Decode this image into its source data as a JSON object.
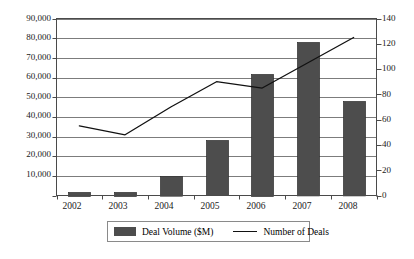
{
  "chart_data": {
    "type": "bar",
    "title": "",
    "xlabel": "",
    "ylabel": "",
    "categories": [
      "2002",
      "2003",
      "2004",
      "2005",
      "2006",
      "2007",
      "2008"
    ],
    "series": [
      {
        "name": "Deal Volume ($M)",
        "type": "bar",
        "axis": "left",
        "color": "#4d4d4d",
        "values": [
          2000,
          2000,
          10000,
          28000,
          62000,
          78000,
          48000
        ]
      },
      {
        "name": "Number of Deals",
        "type": "line",
        "axis": "right",
        "color": "#111111",
        "values": [
          55,
          48,
          70,
          90,
          85,
          105,
          125
        ]
      }
    ],
    "left_axis": {
      "ylim": [
        0,
        90000
      ],
      "tick_step": 10000,
      "ticks": [
        "0",
        "10,000",
        "20,000",
        "30,000",
        "40,000",
        "50,000",
        "60,000",
        "70,000",
        "80,000",
        "90,000"
      ],
      "visible_ticks": [
        "10,000",
        "20,000",
        "30,000",
        "40,000",
        "50,000",
        "60,000",
        "70,000",
        "80,000",
        "90,000"
      ]
    },
    "right_axis": {
      "ylim": [
        0,
        140
      ],
      "tick_step": 20,
      "ticks": [
        "0",
        "20",
        "40",
        "60",
        "80",
        "100",
        "120",
        "140"
      ]
    },
    "grid": true,
    "legend": {
      "position": "bottom",
      "entries": [
        {
          "label": "Deal Volume ($M)",
          "marker": "swatch"
        },
        {
          "label": "Number of Deals",
          "marker": "line"
        }
      ]
    }
  }
}
